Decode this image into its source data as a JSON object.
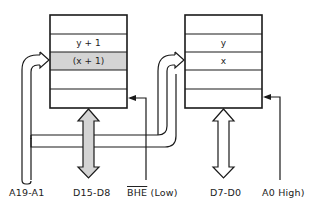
{
  "diagram": {
    "colors": {
      "line": "#1a1a1a",
      "highlight": "#d4d4d4",
      "background": "#ffffff"
    },
    "banks": [
      {
        "name": "high-bank",
        "rows": [
          "",
          "y + 1",
          "(x + 1)",
          "",
          ""
        ],
        "highlighted_row": 2
      },
      {
        "name": "low-bank",
        "rows": [
          "",
          "y",
          "x",
          "",
          ""
        ],
        "highlighted_row": null
      }
    ],
    "labels": {
      "address_bus": "A19-A1",
      "high_data_bus": "D15-D8",
      "bhe_signal": "BHE",
      "bhe_state": " (Low)",
      "low_data_bus": "D7-D0",
      "a0_signal": "A0",
      "a0_state": " High)"
    }
  }
}
